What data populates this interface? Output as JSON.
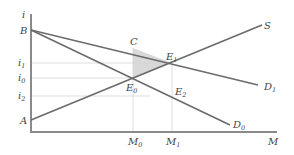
{
  "diagram": {
    "type": "supply-demand",
    "axes": {
      "y_label": "i",
      "x_label": "M"
    },
    "y_ticks": [
      {
        "label": "i",
        "sub": "1",
        "y": 63
      },
      {
        "label": "i",
        "sub": "0",
        "y": 78
      },
      {
        "label": "i",
        "sub": "2",
        "y": 96
      }
    ],
    "x_ticks": [
      {
        "label": "M",
        "sub": "0",
        "x": 133
      },
      {
        "label": "M",
        "sub": "1",
        "x": 172
      }
    ],
    "points": {
      "B": "B",
      "A": "A",
      "C": "C",
      "E0": {
        "label": "E",
        "sub": "0"
      },
      "E1": {
        "label": "E",
        "sub": "1"
      },
      "E2": {
        "label": "E",
        "sub": "2"
      }
    },
    "curves": {
      "S": "S",
      "D1": {
        "label": "D",
        "sub": "1"
      },
      "D0": {
        "label": "D",
        "sub": "0"
      }
    },
    "colors": {
      "line": "#6b6b6b",
      "axis": "#8a8a8a",
      "grid": "#d6d6d6",
      "shade": "#d9d9d9",
      "text": "#444444"
    }
  }
}
